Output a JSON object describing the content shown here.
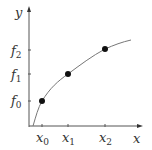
{
  "diagram": {
    "axes": {
      "x_label": "x",
      "y_label": "y",
      "color": "#555555"
    },
    "curve": {
      "color": "#777777",
      "description": "concave increasing curve through three sample points"
    },
    "points": [
      {
        "x_label": "x",
        "x_sub": "0",
        "y_label": "f",
        "y_sub": "0"
      },
      {
        "x_label": "x",
        "x_sub": "1",
        "y_label": "f",
        "y_sub": "1"
      },
      {
        "x_label": "x",
        "x_sub": "2",
        "y_label": "f",
        "y_sub": "2"
      }
    ],
    "point_color": "#111111"
  }
}
